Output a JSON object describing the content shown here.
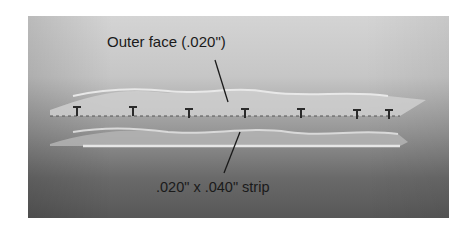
{
  "figure": {
    "type": "photograph",
    "annotations": [
      {
        "id": "outer_face",
        "text": "Outer face (.020\")"
      },
      {
        "id": "strip",
        "text": ".020\" x .040\" strip"
      }
    ]
  }
}
